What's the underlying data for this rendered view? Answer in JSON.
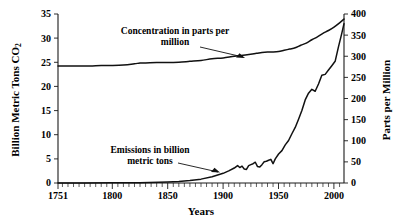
{
  "chart_data": {
    "type": "line",
    "title": "",
    "xlabel": "Years",
    "ylabel": "Billion Metric Tons CO₂",
    "ylabel_right": "Parts per Million",
    "xlim": [
      1751,
      2009
    ],
    "ylim": [
      0,
      35
    ],
    "ylim_right": [
      0,
      400
    ],
    "grid": false,
    "legend": "annotations",
    "xticks": [
      1751,
      1800,
      1850,
      1900,
      1950,
      2000
    ],
    "xtick_labels": [
      "1751",
      "1800",
      "1850",
      "1900",
      "1950",
      "2000"
    ],
    "xminor_tick_step": 5,
    "yticks_left": [
      0,
      5,
      10,
      15,
      20,
      25,
      30,
      35
    ],
    "ytick_labels_left": [
      "0",
      "5",
      "10",
      "15",
      "20",
      "25",
      "30",
      "35"
    ],
    "yticks_right": [
      0,
      50,
      100,
      150,
      200,
      250,
      300,
      350,
      400
    ],
    "ytick_labels_right": [
      "0",
      "50",
      "100",
      "150",
      "200",
      "250",
      "300",
      "350",
      "400"
    ],
    "annotations": [
      {
        "name": "concentration-annotation",
        "line1": "Concentration in parts per",
        "line2": "million",
        "points_to": "concentration-series"
      },
      {
        "name": "emissions-annotation",
        "line1": "Emissions in billion",
        "line2": "metric tons",
        "points_to": "emissions-series"
      }
    ],
    "series": [
      {
        "name": "Concentration in parts per million",
        "axis": "right",
        "unit": "ppm",
        "x": [
          1751,
          1760,
          1770,
          1780,
          1790,
          1800,
          1810,
          1820,
          1825,
          1830,
          1840,
          1850,
          1860,
          1870,
          1880,
          1890,
          1900,
          1910,
          1920,
          1930,
          1935,
          1940,
          1945,
          1950,
          1955,
          1960,
          1965,
          1970,
          1975,
          1980,
          1985,
          1990,
          1995,
          2000,
          2005,
          2009
        ],
        "values": [
          277,
          277,
          277,
          277,
          278,
          278,
          279,
          282,
          284,
          284,
          285,
          285,
          286,
          288,
          290,
          294,
          296,
          300,
          303,
          307,
          309,
          310,
          310,
          311,
          314,
          317,
          320,
          326,
          331,
          339,
          346,
          354,
          361,
          369,
          379,
          388
        ]
      },
      {
        "name": "Emissions in billion metric tons",
        "axis": "left",
        "unit": "billion metric tons CO2",
        "x": [
          1751,
          1775,
          1800,
          1825,
          1850,
          1860,
          1870,
          1880,
          1890,
          1900,
          1905,
          1910,
          1913,
          1915,
          1917,
          1919,
          1921,
          1923,
          1925,
          1927,
          1929,
          1931,
          1933,
          1935,
          1937,
          1939,
          1941,
          1943,
          1945,
          1947,
          1950,
          1953,
          1956,
          1959,
          1962,
          1965,
          1968,
          1971,
          1974,
          1977,
          1980,
          1983,
          1986,
          1989,
          1992,
          1995,
          1998,
          2001,
          2004,
          2007,
          2009
        ],
        "values": [
          0.01,
          0.02,
          0.03,
          0.05,
          0.2,
          0.3,
          0.5,
          0.8,
          1.3,
          2.0,
          2.5,
          3.1,
          3.6,
          3.2,
          3.5,
          2.9,
          2.8,
          3.6,
          3.8,
          4.0,
          4.3,
          3.4,
          3.3,
          3.8,
          4.4,
          4.5,
          4.7,
          4.9,
          4.0,
          5.0,
          6.0,
          6.7,
          7.9,
          8.8,
          10.2,
          11.5,
          13.2,
          15.0,
          17.2,
          18.6,
          19.4,
          19.0,
          20.5,
          22.3,
          22.5,
          23.4,
          24.3,
          25.2,
          28.2,
          31.0,
          33.0
        ]
      }
    ]
  }
}
